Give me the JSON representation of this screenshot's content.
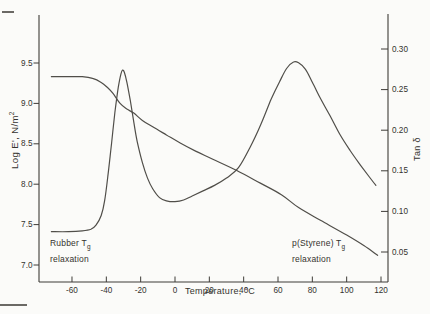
{
  "figure": {
    "background": "#fbfbf9",
    "axis_color": "#3e3c38",
    "curve_color": "#504e49",
    "text_color": "#34322e"
  },
  "chart_data": {
    "type": "line",
    "title": "",
    "xlabel": "Temperature, °C",
    "ylabel_left": "Log E', N/m²",
    "ylabel_left_prefix": "Log E', N/m",
    "ylabel_left_sup": "2",
    "ylabel_right": "Tan δ",
    "grid": false,
    "legend": "none",
    "xlim": [
      -79,
      124
    ],
    "x_ticks": [
      -60,
      -40,
      -20,
      0,
      20,
      40,
      60,
      80,
      100,
      120
    ],
    "x_tick_labels": [
      "-60",
      "-40",
      "-20",
      "0",
      "20",
      "40",
      "60",
      "80",
      "100",
      "120"
    ],
    "y_left_lim": [
      6.79,
      10.08
    ],
    "y_left_tick_labels": [
      "9.5",
      "9.0",
      "8.5",
      "8.0",
      "7.5",
      "7.0"
    ],
    "y_right_lim": [
      0.013,
      0.343
    ],
    "y_right_tick_labels": [
      "0.30",
      "0.25",
      "0.20",
      "0.15",
      "0.10",
      "0.05"
    ],
    "series": [
      {
        "name": "storage modulus Log E'",
        "axis": "left",
        "points": [
          [
            -72,
            9.33
          ],
          [
            -62,
            9.33
          ],
          [
            -54,
            9.33
          ],
          [
            -48,
            9.31
          ],
          [
            -43,
            9.26
          ],
          [
            -39,
            9.19
          ],
          [
            -36,
            9.12
          ],
          [
            -32,
            9.0
          ],
          [
            -28,
            8.93
          ],
          [
            -24,
            8.88
          ],
          [
            -19,
            8.79
          ],
          [
            -13,
            8.71
          ],
          [
            -5,
            8.61
          ],
          [
            3,
            8.51
          ],
          [
            12,
            8.41
          ],
          [
            22,
            8.31
          ],
          [
            36,
            8.17
          ],
          [
            50,
            8.01
          ],
          [
            62,
            7.87
          ],
          [
            72,
            7.71
          ],
          [
            85,
            7.55
          ],
          [
            100,
            7.37
          ],
          [
            110,
            7.24
          ],
          [
            118,
            7.12
          ]
        ]
      },
      {
        "name": "Tan δ",
        "axis": "right",
        "points": [
          [
            -72,
            0.075
          ],
          [
            -62,
            0.075
          ],
          [
            -54,
            0.076
          ],
          [
            -49,
            0.078
          ],
          [
            -46,
            0.083
          ],
          [
            -43,
            0.095
          ],
          [
            -41,
            0.113
          ],
          [
            -39,
            0.145
          ],
          [
            -37,
            0.183
          ],
          [
            -35,
            0.222
          ],
          [
            -33,
            0.253
          ],
          [
            -31.5,
            0.269
          ],
          [
            -30.5,
            0.274
          ],
          [
            -29.5,
            0.271
          ],
          [
            -28,
            0.259
          ],
          [
            -26,
            0.236
          ],
          [
            -24,
            0.21
          ],
          [
            -22,
            0.186
          ],
          [
            -19,
            0.16
          ],
          [
            -16,
            0.141
          ],
          [
            -13,
            0.128
          ],
          [
            -9,
            0.117
          ],
          [
            -5,
            0.113
          ],
          [
            0,
            0.112
          ],
          [
            5,
            0.114
          ],
          [
            10,
            0.119
          ],
          [
            16,
            0.125
          ],
          [
            23,
            0.132
          ],
          [
            30,
            0.141
          ],
          [
            37,
            0.154
          ],
          [
            44,
            0.18
          ],
          [
            50,
            0.207
          ],
          [
            56,
            0.238
          ],
          [
            61,
            0.26
          ],
          [
            65,
            0.276
          ],
          [
            69,
            0.284
          ],
          [
            72,
            0.283
          ],
          [
            76,
            0.275
          ],
          [
            80,
            0.259
          ],
          [
            85,
            0.238
          ],
          [
            90,
            0.219
          ],
          [
            96,
            0.195
          ],
          [
            102,
            0.175
          ],
          [
            108,
            0.157
          ],
          [
            113,
            0.143
          ],
          [
            117,
            0.132
          ]
        ]
      }
    ],
    "annotations": [
      {
        "text": "Rubber Tg relaxation",
        "line1_prefix": "Rubber T",
        "line1_sub": "g",
        "line2": "relaxation"
      },
      {
        "text": "p(Styrene) Tg relaxation",
        "line1_prefix": "p(Styrene) T",
        "line1_sub": "g",
        "line2": "relaxation"
      }
    ]
  }
}
